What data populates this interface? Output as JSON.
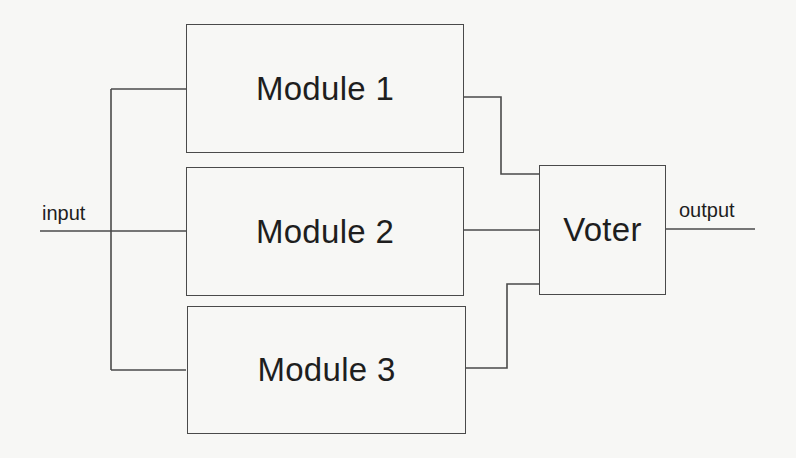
{
  "diagram": {
    "type": "triple-modular-redundancy",
    "input_label": "input",
    "output_label": "output",
    "modules": [
      {
        "label": "Module 1"
      },
      {
        "label": "Module 2"
      },
      {
        "label": "Module 3"
      }
    ],
    "voter": {
      "label": "Voter"
    },
    "colors": {
      "line": "#4a4a4a",
      "text": "#1e1e1e",
      "background": "#f7f7f5"
    }
  }
}
